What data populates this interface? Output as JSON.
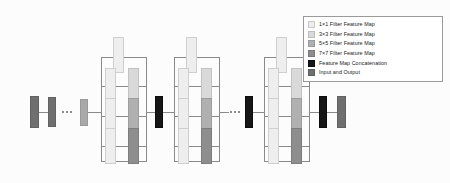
{
  "figure": {
    "type": "neural-network-architecture-diagram",
    "background_color": "#fcfcfc"
  },
  "legend": {
    "border_color": "#9a9a9a",
    "background_color": "#ffffff",
    "items": [
      {
        "label": "1×1 Filter Feature Map",
        "swatch": "#eeeeee",
        "swatch_border": "#c9c9c9",
        "key": "filter-1x1"
      },
      {
        "label": "3×3 Filter Feature Map",
        "swatch": "#d9d9d9",
        "swatch_border": "#bdbdbd",
        "key": "filter-3x3"
      },
      {
        "label": "5×5 Filter Feature Map",
        "swatch": "#b0b0b0",
        "swatch_border": "#9a9a9a",
        "key": "filter-5x5"
      },
      {
        "label": "7×7 Filter Feature Map",
        "swatch": "#8e8e8e",
        "swatch_border": "#7b7b7b",
        "key": "filter-7x7"
      },
      {
        "label": "Feature Map Concatenation",
        "swatch": "#161616",
        "swatch_border": "#0d0d0d",
        "key": "concatenation"
      },
      {
        "label": "Input and Output",
        "swatch": "#6f6f6f",
        "swatch_border": "#5f5f5f",
        "key": "input-output"
      }
    ]
  },
  "diagram": {
    "wire_color": "#8a8a8a",
    "ellipsis_glyph": "•••",
    "ellipsis_count": 3,
    "input_stack": {
      "blocks": [
        {
          "name": "input-block",
          "type": "input-output"
        },
        {
          "name": "early-layer-block",
          "type": "input-output"
        },
        {
          "name": "pre-module-block",
          "type": "input-output-light"
        }
      ],
      "ellipsis_after_index": 1
    },
    "modules": [
      {
        "name": "inception-module-1",
        "branches": [
          {
            "name": "branch-1x1",
            "blocks": [
              "filter-1x1"
            ]
          },
          {
            "name": "branch-3x3",
            "blocks": [
              "filter-1x1",
              "filter-3x3"
            ]
          },
          {
            "name": "branch-5x5",
            "blocks": [
              "filter-1x1",
              "filter-5x5"
            ]
          },
          {
            "name": "branch-7x7",
            "blocks": [
              "filter-1x1",
              "filter-7x7"
            ]
          }
        ]
      },
      {
        "name": "inception-module-2",
        "branches": [
          {
            "name": "branch-1x1",
            "blocks": [
              "filter-1x1"
            ]
          },
          {
            "name": "branch-3x3",
            "blocks": [
              "filter-1x1",
              "filter-3x3"
            ]
          },
          {
            "name": "branch-5x5",
            "blocks": [
              "filter-1x1",
              "filter-5x5"
            ]
          },
          {
            "name": "branch-7x7",
            "blocks": [
              "filter-1x1",
              "filter-7x7"
            ]
          }
        ]
      },
      {
        "name": "inception-module-3",
        "branches": [
          {
            "name": "branch-1x1",
            "blocks": [
              "filter-1x1"
            ]
          },
          {
            "name": "branch-3x3",
            "blocks": [
              "filter-1x1",
              "filter-3x3"
            ]
          },
          {
            "name": "branch-5x5",
            "blocks": [
              "filter-1x1",
              "filter-5x5"
            ]
          },
          {
            "name": "branch-7x7",
            "blocks": [
              "filter-1x1",
              "filter-7x7"
            ]
          }
        ]
      }
    ],
    "concatenations": [
      {
        "name": "concat-after-module-1"
      },
      {
        "name": "concat-after-module-2"
      },
      {
        "name": "concat-after-module-3"
      }
    ],
    "ellipsis_between_modules": [
      {
        "name": "ellipsis-module-2-to-3"
      }
    ],
    "output_block": {
      "name": "output-block",
      "type": "input-output"
    }
  }
}
